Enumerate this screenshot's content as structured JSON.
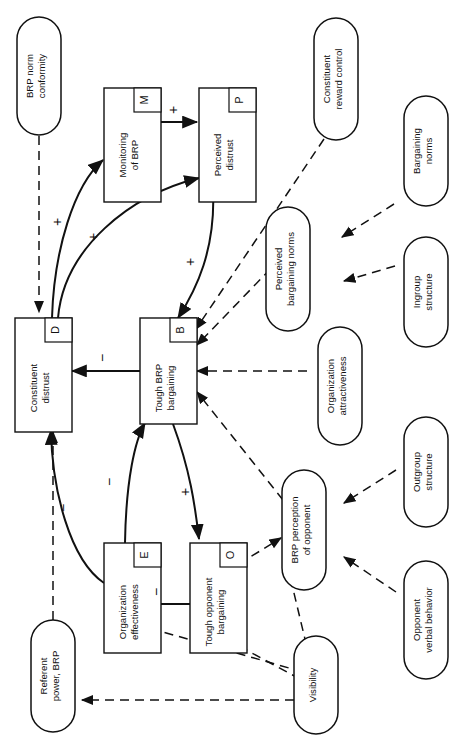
{
  "figure": {
    "orientation": "rotated-90-ccw"
  },
  "nodes": {
    "boxes": [
      {
        "id": "M",
        "code": "M",
        "label": "Monitoring of BRP",
        "lines": [
          "Monitoring",
          "of BRP"
        ]
      },
      {
        "id": "P",
        "code": "P",
        "label": "Perceived distrust",
        "lines": [
          "Perceived",
          "distrust"
        ]
      },
      {
        "id": "D",
        "code": "D",
        "label": "Constituent distrust",
        "lines": [
          "Constituent",
          "distrust"
        ]
      },
      {
        "id": "B",
        "code": "B",
        "label": "Tough BRP bargaining",
        "lines": [
          "Tough BRP",
          "bargaining"
        ]
      },
      {
        "id": "E",
        "code": "E",
        "label": "Organization effectiveness",
        "lines": [
          "Organization",
          "effectiveness"
        ]
      },
      {
        "id": "O",
        "code": "O",
        "label": "Tough opponent bargaining",
        "lines": [
          "Tough opponent",
          "bargaining"
        ]
      }
    ],
    "ovals": [
      {
        "id": "n1",
        "label": "BRP norm conformity",
        "lines": [
          "BRP norm",
          "conformity"
        ]
      },
      {
        "id": "n2",
        "label": "Constituent reward control",
        "lines": [
          "Constituent",
          "reward control"
        ]
      },
      {
        "id": "n3",
        "label": "Bargaining norms",
        "lines": [
          "Bargaining",
          "norms"
        ]
      },
      {
        "id": "n4",
        "label": "Perceived bargaining norms",
        "lines": [
          "Perceived",
          "bargaining norms"
        ]
      },
      {
        "id": "n5",
        "label": "Ingroup structure",
        "lines": [
          "Ingroup",
          "structure"
        ]
      },
      {
        "id": "n6",
        "label": "Organization attractiveness",
        "lines": [
          "Organization",
          "attractiveness"
        ]
      },
      {
        "id": "n7",
        "label": "Outgroup structure",
        "lines": [
          "Outgroup",
          "structure"
        ]
      },
      {
        "id": "n8",
        "label": "BRP perception of opponent",
        "lines": [
          "BRP perception",
          "of opponent"
        ]
      },
      {
        "id": "n9",
        "label": "Opponent verbal behavior",
        "lines": [
          "Opponent",
          "verbal behavior"
        ]
      },
      {
        "id": "n10",
        "label": "Referent power, BRP",
        "lines": [
          "Referent",
          "power, BRP"
        ]
      },
      {
        "id": "n11",
        "label": "Visibility",
        "lines": [
          "Visibility"
        ]
      }
    ]
  },
  "edge_labels": [
    {
      "id": "s1",
      "sign": "+",
      "from": "M",
      "to": "P",
      "note": "Monitoring of BRP to Perceived distrust"
    },
    {
      "id": "s2",
      "sign": "+",
      "from": "D",
      "to": "M",
      "note": "Constituent distrust to Monitoring of BRP"
    },
    {
      "id": "s3",
      "sign": "+",
      "from": "D",
      "to": "P",
      "note": "Constituent distrust to Perceived distrust"
    },
    {
      "id": "s4",
      "sign": "+",
      "from": "P",
      "to": "B",
      "note": "Perceived distrust to Tough BRP bargaining"
    },
    {
      "id": "s5",
      "sign": "−",
      "from": "B",
      "to": "D",
      "note": "Tough BRP bargaining to Constituent distrust"
    },
    {
      "id": "s6",
      "sign": "−",
      "from": "E",
      "to": "B",
      "note": "Organization effectiveness to Tough BRP bargaining"
    },
    {
      "id": "s7",
      "sign": "+",
      "from": "B",
      "to": "O",
      "note": "Tough BRP bargaining to Tough opponent bargaining"
    },
    {
      "id": "s8",
      "sign": "−",
      "from": "O",
      "to": "E",
      "note": "Tough opponent bargaining to Organization effectiveness"
    },
    {
      "id": "s9",
      "sign": "−",
      "from": "E",
      "to": "D",
      "note": "Organization effectiveness to Constituent distrust"
    }
  ]
}
